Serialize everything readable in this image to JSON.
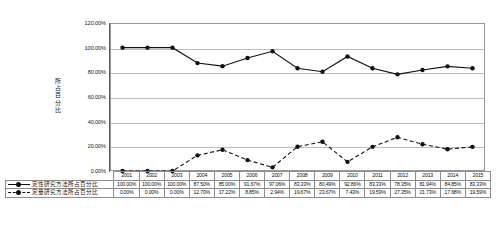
{
  "chart_data": {
    "type": "line",
    "title": "",
    "xlabel": "",
    "ylabel": "所占百分比",
    "ylim": [
      0,
      120
    ],
    "ytick_labels": [
      "120.00%",
      "100.00%",
      "80.00%",
      "60.00%",
      "40.00%",
      "20.00%",
      "0.00%"
    ],
    "ytick_values": [
      120,
      100,
      80,
      60,
      40,
      20,
      0
    ],
    "grid": true,
    "legend_position": "bottom-table",
    "categories": [
      "2001",
      "2002",
      "2003",
      "2004",
      "2005",
      "2006",
      "2007",
      "2008",
      "2009",
      "2010",
      "2011",
      "2012",
      "2013",
      "2014",
      "2015"
    ],
    "series": [
      {
        "name": "定性研究方法所占百分比",
        "style": "solid",
        "marker": "circle",
        "color": "#111111",
        "values": [
          100.0,
          100.0,
          100.0,
          87.5,
          85.0,
          91.67,
          97.06,
          83.33,
          80.49,
          92.86,
          83.33,
          78.35,
          81.94,
          84.85,
          83.33
        ],
        "labels": [
          "100.00%",
          "100.00%",
          "100.00%",
          "87.50%",
          "85.00%",
          "91.67%",
          "97.06%",
          "83.33%",
          "80.49%",
          "92.86%",
          "83.33%",
          "78.35%",
          "81.94%",
          "84.85%",
          "83.33%"
        ]
      },
      {
        "name": "定量研究方法所占百分比",
        "style": "dashed",
        "marker": "circle",
        "color": "#111111",
        "values": [
          0.0,
          0.0,
          0.0,
          12.7,
          17.22,
          8.85,
          2.94,
          19.67,
          23.67,
          7.43,
          19.59,
          27.35,
          21.73,
          17.68,
          19.59
        ],
        "labels": [
          "0.00%",
          "0.00%",
          "0.00%",
          "12.70%",
          "17.22%",
          "8.85%",
          "2.94%",
          "19.67%",
          "23.67%",
          "7.43%",
          "19.59%",
          "27.35%",
          "21.73%",
          "17.68%",
          "19.59%"
        ]
      }
    ]
  }
}
